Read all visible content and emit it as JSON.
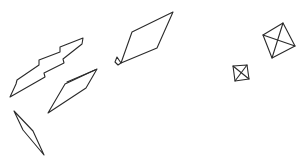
{
  "canvas": {
    "width": 304,
    "height": 166,
    "background": "#ffffff",
    "stroke_color": "#2a2a2a"
  },
  "shapes": [
    {
      "name": "lightning-bolt-shape",
      "points": "10,97 17,84 16,79 36,65 35,62 56,57 62,53 59,48 82,29 84,22 38,52 36,57 12,76 17,84",
      "paths": [
        "M10,97 L45,77 L44,73 L64,63 L63,59 L82,44 L83,38 L60,47 L60,52 L39,60 L39,65 L17,80 L16,84 Z"
      ]
    },
    {
      "name": "rhombus-with-cap-shape",
      "paths": [
        "M132,32 L173,12 L157,48 L121,63 Z",
        "M117,57 L115,62 L118,65 L121,63 Z"
      ]
    },
    {
      "name": "thin-quad-shape",
      "paths": [
        "M65,84 L97,69 L86,88 L48,113 Z",
        "M67,82 L95,70"
      ]
    },
    {
      "name": "thin-diamond-shape",
      "paths": [
        "M14,111 L33,131 L44,155 L23,130 Z"
      ]
    },
    {
      "name": "large-square-with-diagonals-shape",
      "paths": [
        "M263,35 L283,23 L295,46 L272,58 Z",
        "M263,35 L295,46",
        "M283,23 L272,58"
      ]
    },
    {
      "name": "small-square-with-diagonals-shape",
      "paths": [
        "M233,66 L247,65 L249,79 L235,81 Z",
        "M233,66 L249,79",
        "M247,65 L235,81"
      ]
    }
  ]
}
